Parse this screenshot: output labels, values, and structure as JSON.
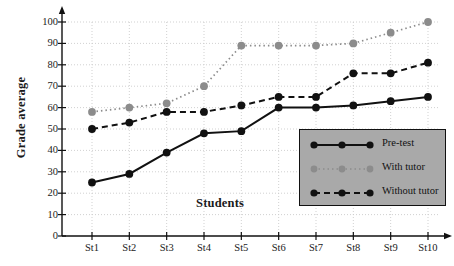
{
  "chart_data": {
    "type": "line",
    "title": "",
    "xlabel": "Students",
    "ylabel": "Grade average",
    "categories": [
      "St1",
      "St2",
      "St3",
      "St4",
      "St5",
      "St6",
      "St7",
      "St8",
      "St9",
      "St10"
    ],
    "ylim": [
      0,
      100
    ],
    "yticks": [
      0,
      10,
      20,
      30,
      40,
      50,
      60,
      70,
      80,
      90,
      100
    ],
    "grid": true,
    "legend_position": "lower-right",
    "series": [
      {
        "name": "Pre-test",
        "values": [
          25,
          29,
          39,
          48,
          49,
          60,
          60,
          61,
          63,
          65
        ],
        "color": "#111111",
        "marker_color": "#111111",
        "line_style": "solid"
      },
      {
        "name": "With tutor",
        "values": [
          58,
          60,
          62,
          70,
          89,
          89,
          89,
          90,
          95,
          100
        ],
        "color": "#8c8c8c",
        "marker_color": "#8c8c8c",
        "line_style": "dotted"
      },
      {
        "name": "Without tutor",
        "values": [
          50,
          53,
          58,
          58,
          61,
          65,
          65,
          76,
          76,
          81
        ],
        "color": "#111111",
        "marker_color": "#111111",
        "line_style": "dashed"
      }
    ]
  },
  "legend": {
    "items": [
      {
        "label": "Pre-test"
      },
      {
        "label": "With tutor"
      },
      {
        "label": "Without tutor"
      }
    ],
    "background_color": "#a9a9a9",
    "border_color": "#111111"
  },
  "axes": {
    "y_title": "Grade average",
    "x_title": "Students",
    "y_tick_labels": [
      "0",
      "10",
      "20",
      "30",
      "40",
      "50",
      "60",
      "70",
      "80",
      "90",
      "100"
    ],
    "x_tick_labels": [
      "St1",
      "St2",
      "St3",
      "St4",
      "St5",
      "St6",
      "St7",
      "St8",
      "St9",
      "St10"
    ],
    "axis_color": "#111111",
    "grid_color": "#cccccc"
  }
}
